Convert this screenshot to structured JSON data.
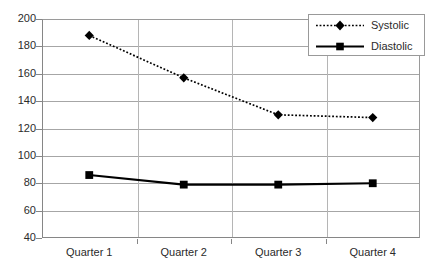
{
  "chart_data": {
    "type": "line",
    "title": "",
    "xlabel": "",
    "ylabel": "",
    "categories": [
      "Quarter 1",
      "Quarter 2",
      "Quarter 3",
      "Quarter 4"
    ],
    "ylim": [
      40,
      200
    ],
    "ytick_step": 20,
    "yticks": [
      200,
      180,
      160,
      140,
      120,
      100,
      80,
      60,
      40
    ],
    "grid": true,
    "legend_position": "top-right",
    "series": [
      {
        "name": "Systolic",
        "values": [
          188,
          157,
          130,
          128
        ],
        "line_style": "dotted",
        "marker": "diamond",
        "color": "#000000"
      },
      {
        "name": "Diastolic",
        "values": [
          86,
          79,
          79,
          80
        ],
        "line_style": "solid",
        "marker": "square",
        "color": "#000000"
      }
    ]
  },
  "legend": {
    "items": [
      {
        "label": "Systolic",
        "marker": "diamond-marker-icon"
      },
      {
        "label": "Diastolic",
        "marker": "square-marker-icon"
      }
    ]
  },
  "colors": {
    "grid": "#a6a6a6",
    "axis": "#868686",
    "series": "#000000",
    "background": "#ffffff",
    "text": "#2b2b2b"
  }
}
